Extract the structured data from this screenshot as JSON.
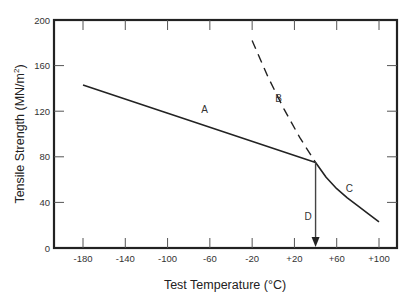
{
  "chart_data": {
    "type": "line",
    "title": "",
    "xlabel": "Test Temperature (°C)",
    "ylabel": "Tensile Strength (MN/m²)",
    "ylabel_parts": {
      "main": "Tensile Strength (MN/m",
      "sup": "2",
      "end": ")"
    },
    "xlim": [
      -208,
      110
    ],
    "ylim": [
      0,
      200
    ],
    "x_ticks": [
      -180,
      -140,
      -100,
      -60,
      -20,
      20,
      60,
      100
    ],
    "x_tick_labels": [
      "-180",
      "-140",
      "-100",
      "-60",
      "-20",
      "+20",
      "+60",
      "+100"
    ],
    "y_ticks": [
      0,
      40,
      80,
      120,
      160,
      200
    ],
    "y_tick_labels": [
      "0",
      "40",
      "80",
      "120",
      "160",
      "200"
    ],
    "grid": false,
    "legend": null,
    "series": [
      {
        "name": "A",
        "style": "solid",
        "x": [
          -180,
          40
        ],
        "y": [
          143,
          75
        ],
        "label_at": [
          -65,
          118
        ]
      },
      {
        "name": "B",
        "style": "dashed",
        "x": [
          -20,
          -5,
          10,
          25,
          40
        ],
        "y": [
          182,
          150,
          122,
          97,
          75
        ],
        "label_at": [
          5,
          128
        ]
      },
      {
        "name": "C",
        "style": "solid",
        "x": [
          40,
          50,
          60,
          70,
          80,
          90,
          100
        ],
        "y": [
          75,
          62,
          52,
          44,
          37,
          30,
          23
        ],
        "label_at": [
          72,
          49
        ]
      },
      {
        "name": "D",
        "style": "arrow",
        "x": [
          40,
          40
        ],
        "y": [
          75,
          0
        ],
        "label_at": [
          33,
          25
        ]
      }
    ]
  },
  "labels": {
    "A": "A",
    "B": "B",
    "C": "C",
    "D": "D"
  }
}
